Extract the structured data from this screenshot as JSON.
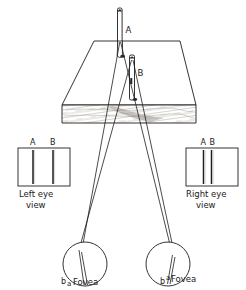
{
  "figure": {
    "stroke_color": "#1d1d1d",
    "fill_color": "#ffffff",
    "board_shading_color": "#b9b5ad",
    "pins": [
      {
        "id": "pin-a",
        "label": "A"
      },
      {
        "id": "pin-b",
        "label": "B"
      }
    ],
    "left_eye_view": {
      "line_a_label": "A",
      "line_b_label": "B",
      "caption_line1": "Left  eye",
      "caption_line2": "view"
    },
    "right_eye_view": {
      "line_a_label": "A",
      "line_b_label": "B",
      "caption_line1": "Right  eye",
      "caption_line2": "view"
    },
    "left_eye": {
      "image_b_label": "b",
      "image_a_label": "a",
      "fovea_label": "Fovea"
    },
    "right_eye": {
      "image_b_label": "b",
      "image_a_label": "a",
      "fovea_label": "Fovea"
    }
  }
}
